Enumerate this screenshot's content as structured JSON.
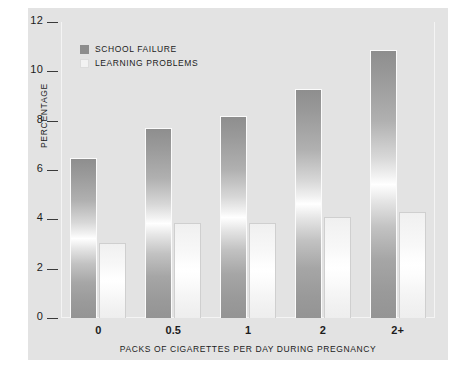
{
  "chart_data": {
    "type": "bar",
    "title": "",
    "xlabel": "PACKS OF CIGARETTES PER DAY DURING PREGNANCY",
    "ylabel": "PERCENTAGE",
    "categories": [
      "0",
      "0.5",
      "1",
      "2",
      "2+"
    ],
    "series": [
      {
        "name": "SCHOOL FAILURE",
        "color": "#8d8d8d",
        "values": [
          6.5,
          7.7,
          8.2,
          9.3,
          10.85
        ]
      },
      {
        "name": "LEARNING PROBLEMS",
        "color": "#f2f2f2",
        "values": [
          3.05,
          3.85,
          3.85,
          4.1,
          4.3
        ]
      }
    ],
    "ylim": [
      0,
      12
    ],
    "ytick_values": [
      0,
      2,
      4,
      6,
      8,
      10,
      12
    ],
    "ytick_labels": [
      "0",
      "2",
      "4",
      "6",
      "8",
      "10",
      "12"
    ],
    "grid": false,
    "legend_position": "upper-left-inside"
  },
  "legend": {
    "entries": [
      {
        "label": "SCHOOL FAILURE",
        "swatch": "dark"
      },
      {
        "label": "LEARNING PROBLEMS",
        "swatch": "light"
      }
    ]
  },
  "colors": {
    "panel_background": "#e3e3e3",
    "page_background": "#ffffff",
    "bar_dark": "#8d8d8d",
    "bar_light": "#f2f2f2",
    "text": "#1c1c1c"
  }
}
